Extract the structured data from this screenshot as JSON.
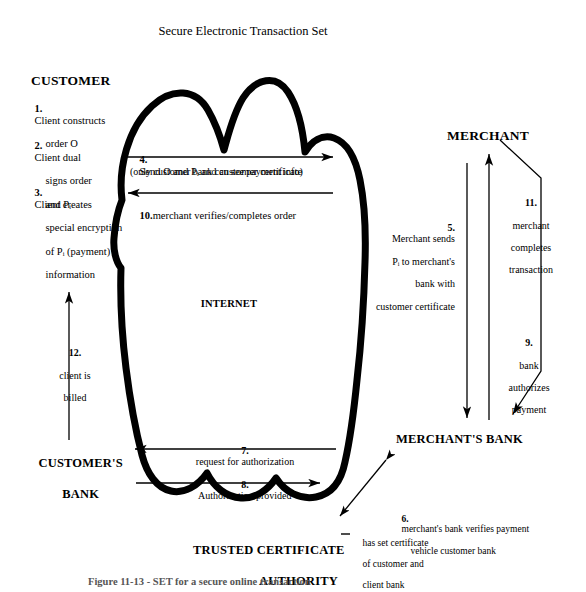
{
  "diagram": {
    "title": "Secure Electronic Transaction Set",
    "caption": "Figure 11-13 - SET for a secure online transaction",
    "cloud_label": "INTERNET",
    "nodes": {
      "customer": "CUSTOMER",
      "merchant": "MERCHANT",
      "customers_bank_line1": "CUSTOMER'S",
      "customers_bank_line2": "BANK",
      "merchants_bank": "MERCHANT'S BANK",
      "tca_line1": "TRUSTED CERTIFICATE",
      "tca_line2": "AUTHORITY"
    },
    "customer_steps": [
      {
        "num": "1.",
        "lines": [
          "Client constructs",
          "order O"
        ]
      },
      {
        "num": "2.",
        "lines": [
          "Client dual",
          "signs order",
          "and Pᵢ"
        ]
      },
      {
        "num": "3.",
        "lines": [
          "Client creates",
          "special encryption",
          "of Pᵢ (payment)",
          "information"
        ]
      }
    ],
    "flows": {
      "step4_num": "4.",
      "step4_text": "Send O and Pᵢ and customer certificate",
      "step4_note": "(only customer bank can see payment info)",
      "step10_num": "10.",
      "step10_text": "merchant verifies/completes order",
      "step5_num": "5.",
      "step5_lines": [
        "Merchant sends",
        "Pᵢ to merchant's",
        "bank with",
        "customer certificate"
      ],
      "step11_num": "11.",
      "step11_lines": [
        "merchant",
        "completes",
        "transaction"
      ],
      "step9_num": "9.",
      "step9_lines": [
        "bank",
        "authorizes",
        "payment"
      ],
      "step12_num": "12.",
      "step12_lines": [
        "client is",
        "billed"
      ],
      "step7_num": "7.",
      "step7_text": "request for authorization",
      "step8_num": "8.",
      "step8_text": "Authorization provided",
      "step6_num": "6.",
      "step6_lines": [
        "merchant's bank verifies payment",
        "vehicle customer bank"
      ],
      "tca_note_lines": [
        "has set certificate",
        "of customer and",
        "client bank"
      ]
    },
    "colors": {
      "ink": "#000000",
      "paper": "#ffffff"
    }
  }
}
